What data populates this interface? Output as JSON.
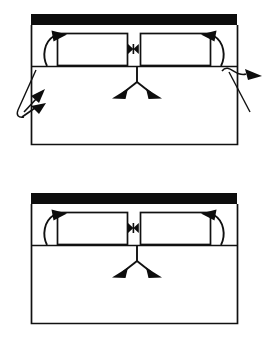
{
  "figure": {
    "kind": "line-diagram",
    "title": "",
    "background_color": "#ffffff",
    "ink_color": "#111111",
    "fill_black": "#0d0d0d",
    "panel_count": 2,
    "labels": {
      "upper_panel": "",
      "lower_panel": "",
      "black_bar": "",
      "left_box": "",
      "right_box": "",
      "bowtie_connector": "",
      "left_curved_arrow": "",
      "right_curved_arrow": "",
      "split_arrow": "",
      "left_leader_arrow": "",
      "right_leader_arrow": ""
    },
    "panels": [
      {
        "id": "upper",
        "outer_frame": {
          "x": 31,
          "y": 25,
          "width": 207,
          "height": 120
        },
        "black_bar": {
          "x": 31,
          "y": 14,
          "width": 206,
          "height": 11
        },
        "inner_rule_y": 66,
        "left_box": {
          "x": 57,
          "y": 33,
          "width": 71,
          "height": 33
        },
        "right_box": {
          "x": 140,
          "y": 33,
          "width": 71,
          "height": 33
        },
        "bowtie": {
          "cx": 133,
          "cy": 49,
          "half_width": 5,
          "half_height": 5
        },
        "left_curved_arrow": true,
        "right_curved_arrow": true,
        "split_arrow": {
          "apex_x": 137,
          "apex_y": 66
        },
        "left_leader_arrow": true,
        "right_leader_arrow": true
      },
      {
        "id": "lower",
        "outer_frame": {
          "x": 31,
          "y": 204,
          "width": 207,
          "height": 120
        },
        "black_bar": {
          "x": 31,
          "y": 193,
          "width": 206,
          "height": 11
        },
        "inner_rule_y": 245,
        "left_box": {
          "x": 57,
          "y": 212,
          "width": 71,
          "height": 33
        },
        "right_box": {
          "x": 140,
          "y": 212,
          "width": 71,
          "height": 33
        },
        "bowtie": {
          "cx": 133,
          "cy": 228,
          "half_width": 5,
          "half_height": 5
        },
        "left_curved_arrow": true,
        "right_curved_arrow": true,
        "split_arrow": {
          "apex_x": 137,
          "apex_y": 245
        },
        "left_leader_arrow": false,
        "right_leader_arrow": false
      }
    ]
  }
}
